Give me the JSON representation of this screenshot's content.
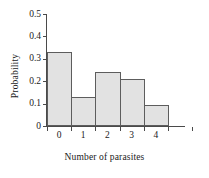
{
  "chart_data": {
    "type": "bar",
    "title": "",
    "subtitle": "",
    "xlabel": "Number of parasites",
    "ylabel": "Probability",
    "categories": [
      "0",
      "1",
      "2",
      "3",
      "4"
    ],
    "values": [
      0.33,
      0.13,
      0.24,
      0.21,
      0.095
    ],
    "series": [
      {
        "name": "Probability",
        "values": [
          0.33,
          0.13,
          0.24,
          0.21,
          0.095
        ]
      }
    ],
    "ylim": [
      0,
      0.5
    ],
    "yticks": [
      "0",
      "0.1",
      "0.2",
      "0.3",
      "0.4",
      "0.5"
    ],
    "ytick_values": [
      0,
      0.1,
      0.2,
      0.3,
      0.4,
      0.5
    ],
    "xticks": [
      "0",
      "1",
      "2",
      "3",
      "4"
    ],
    "grid": false,
    "legend": false,
    "legend_position": "none",
    "annotations": [],
    "bar_fill_color": "#e2e2e2",
    "bar_edge_color": "#5d5d5d",
    "axis_color": "#4a4a4a",
    "background_color": "#ffffff",
    "text_color": "#1a1a1a"
  }
}
